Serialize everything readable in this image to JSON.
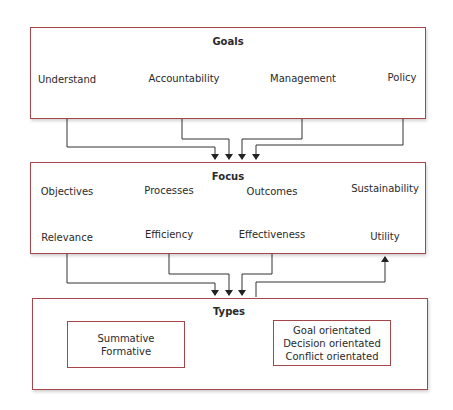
{
  "goals": {
    "title": "Goals",
    "items": [
      "Understand",
      "Accountability",
      "Management",
      "Policy"
    ]
  },
  "focus": {
    "title": "Focus",
    "pairs": [
      {
        "from": "Objectives",
        "to": "Relevance"
      },
      {
        "from": "Processes",
        "to": "Efficiency"
      },
      {
        "from": "Outcomes",
        "to": "Effectiveness"
      },
      {
        "from": "Sustainability",
        "to": "Utility"
      }
    ]
  },
  "types": {
    "title": "Types",
    "left_box": {
      "lines": [
        "Summative",
        "Formative"
      ]
    },
    "right_box": {
      "lines": [
        "Goal orientated",
        "Decision orientated",
        "Conflict orientated"
      ]
    }
  },
  "colors": {
    "box_border": "#a5464b",
    "line": "#333333"
  }
}
